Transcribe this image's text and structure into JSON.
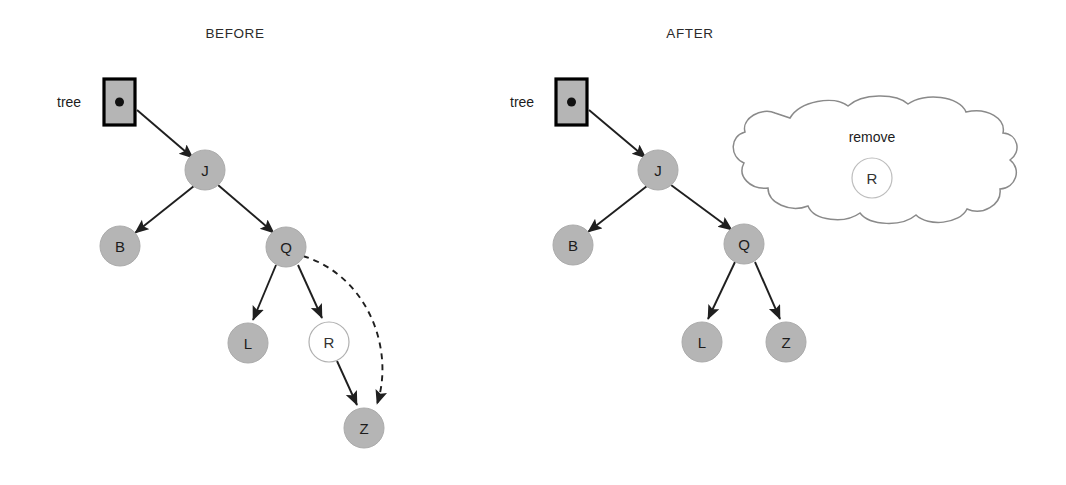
{
  "figure": {
    "background": "#ffffff",
    "node_fill": "#b5b5b5",
    "node_stroke": "#a8a8a8",
    "empty_node_fill": "#ffffff",
    "empty_node_stroke": "#b0b0b0",
    "edge_color": "#1f1f1f",
    "cloud_stroke": "#8a8a8a",
    "box_fill": "#b5b5b5",
    "box_stroke": "#000000",
    "text_color": "#1c1c1c"
  },
  "panels": [
    {
      "id": "before",
      "title": "BEFORE",
      "title_x": 235,
      "title_y": 38,
      "root_pointer": {
        "label": "tree",
        "label_x": 57,
        "label_y": 107,
        "box_x": 104,
        "box_y": 79,
        "box_w": 31,
        "box_h": 46,
        "dot_x": 119,
        "dot_y": 102,
        "dot_r": 4.5
      },
      "nodes": [
        {
          "id": "J",
          "label": "J",
          "cx": 205,
          "cy": 170,
          "r": 20,
          "filled": true
        },
        {
          "id": "B",
          "label": "B",
          "cx": 120,
          "cy": 246,
          "r": 20,
          "filled": true
        },
        {
          "id": "Q",
          "label": "Q",
          "cx": 286,
          "cy": 247,
          "r": 20,
          "filled": true
        },
        {
          "id": "L",
          "label": "L",
          "cx": 248,
          "cy": 343,
          "r": 20,
          "filled": true
        },
        {
          "id": "R",
          "label": "R",
          "cx": 329,
          "cy": 342,
          "r": 20,
          "filled": false
        },
        {
          "id": "Z",
          "label": "Z",
          "cx": 364,
          "cy": 428,
          "r": 20,
          "filled": true
        }
      ],
      "edges": [
        {
          "from": "tree",
          "to": "J",
          "style": "solid"
        },
        {
          "from": "J",
          "to": "B",
          "style": "solid"
        },
        {
          "from": "J",
          "to": "Q",
          "style": "solid"
        },
        {
          "from": "Q",
          "to": "L",
          "style": "solid"
        },
        {
          "from": "Q",
          "to": "R",
          "style": "solid"
        },
        {
          "from": "R",
          "to": "Z",
          "style": "solid"
        },
        {
          "from": "Q",
          "to": "Z",
          "style": "dashed"
        }
      ]
    },
    {
      "id": "after",
      "title": "AFTER",
      "title_x": 690,
      "title_y": 38,
      "root_pointer": {
        "label": "tree",
        "label_x": 510,
        "label_y": 107,
        "box_x": 556,
        "box_y": 79,
        "box_w": 31,
        "box_h": 46,
        "dot_x": 571,
        "dot_y": 102,
        "dot_r": 4.5
      },
      "nodes": [
        {
          "id": "J",
          "label": "J",
          "cx": 658,
          "cy": 170,
          "r": 20,
          "filled": true
        },
        {
          "id": "B",
          "label": "B",
          "cx": 573,
          "cy": 245,
          "r": 20,
          "filled": true
        },
        {
          "id": "Q",
          "label": "Q",
          "cx": 744,
          "cy": 244,
          "r": 20,
          "filled": true
        },
        {
          "id": "L",
          "label": "L",
          "cx": 702,
          "cy": 342,
          "r": 20,
          "filled": true
        },
        {
          "id": "Z",
          "label": "Z",
          "cx": 786,
          "cy": 342,
          "r": 20,
          "filled": true
        }
      ],
      "edges": [
        {
          "from": "tree",
          "to": "J",
          "style": "solid"
        },
        {
          "from": "J",
          "to": "B",
          "style": "solid"
        },
        {
          "from": "J",
          "to": "Q",
          "style": "solid"
        },
        {
          "from": "Q",
          "to": "L",
          "style": "solid"
        },
        {
          "from": "Q",
          "to": "Z",
          "style": "solid"
        }
      ],
      "cloud": {
        "label": "remove",
        "label_x": 872,
        "label_y": 142,
        "x": 733,
        "y": 100,
        "w": 282,
        "h": 123,
        "removed_node": {
          "label": "R",
          "cx": 872,
          "cy": 178,
          "r": 20
        }
      }
    }
  ]
}
